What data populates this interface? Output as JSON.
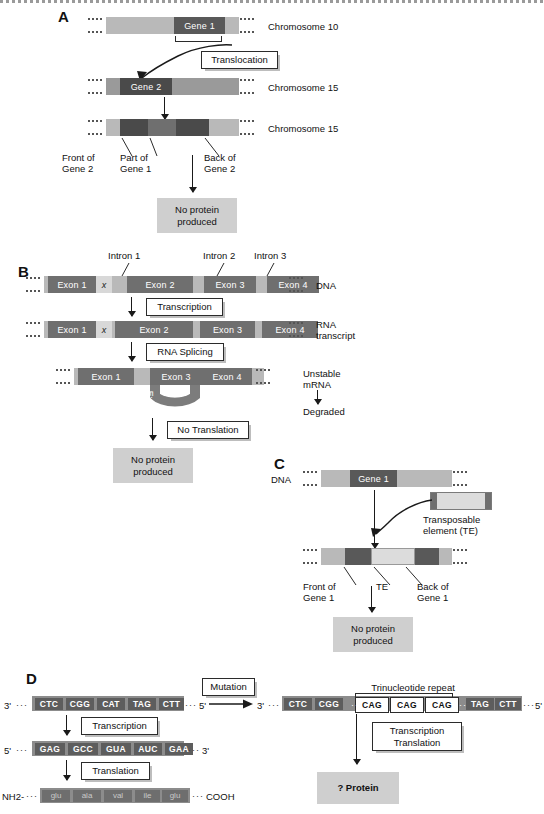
{
  "figure": {
    "panels": [
      "A",
      "B",
      "C",
      "D"
    ]
  },
  "panel_a": {
    "letter": "A",
    "rows": [
      {
        "gene_label": "Gene 1",
        "chromosome_label": "Chromosome 10"
      },
      {
        "gene_label": "Gene 2",
        "chromosome_label": "Chromosome 15"
      },
      {
        "gene_label": "",
        "chromosome_label": "Chromosome 15"
      }
    ],
    "process_label": "Translocation",
    "callouts": [
      "Front of\nGene 2",
      "Part of\nGene 1",
      "Back of\nGene 2"
    ],
    "result": "No protein\nproduced"
  },
  "panel_b": {
    "letter": "B",
    "intron_labels": [
      "Intron 1",
      "Intron 2",
      "Intron 3"
    ],
    "mutation_marker": "x",
    "dna_row": {
      "exons": [
        "Exon 1",
        "Exon 2",
        "Exon 3",
        "Exon 4"
      ],
      "row_label": "DNA"
    },
    "rna_row": {
      "exons": [
        "Exon 1",
        "Exon 2",
        "Exon 3",
        "Exon 4"
      ],
      "row_label": "RNA\ntranscript"
    },
    "spliced_row": {
      "exons": [
        "Exon 1",
        "Exon 3",
        "Exon 4"
      ],
      "looped_exon": "Exon 2"
    },
    "steps": [
      "Transcription",
      "RNA Splicing",
      "No Translation"
    ],
    "side_note": "Unstable\nmRNA",
    "side_note_result": "Degraded",
    "result": "No protein\nproduced"
  },
  "panel_c": {
    "letter": "C",
    "dna_label": "DNA",
    "gene_label": "Gene 1",
    "te_label": "Transposable\nelement (TE)",
    "callouts": [
      "Front of\nGene 1",
      "TE",
      "Back of\nGene 1"
    ],
    "result": "No protein\nproduced"
  },
  "panel_d": {
    "letter": "D",
    "left": {
      "dna_five_prime": "5'",
      "dna_three_prime": "3'",
      "dna_codons": [
        "CTC",
        "CGG",
        "CAT",
        "TAG",
        "CTT"
      ],
      "rna_five_prime": "5'",
      "rna_three_prime": "3'",
      "rna_codons": [
        "GAG",
        "GCC",
        "GUA",
        "AUC",
        "GAA"
      ],
      "protein_n_terminus": "NH2-",
      "protein_c_terminus": "COOH",
      "amino_acids": [
        "glu",
        "ala",
        "val",
        "ile",
        "glu"
      ],
      "steps": [
        "Transcription",
        "Translation"
      ]
    },
    "mutation_label": "Mutation",
    "arrow_from": "5'",
    "arrow_to": "3'",
    "right": {
      "repeat_label": "Trinucleotide repeat",
      "codons_before": [
        "CTC",
        "CGG"
      ],
      "repeat_codons": [
        "CAG",
        "CAG",
        "CAG"
      ],
      "codons_after": [
        "TAG",
        "CTT"
      ],
      "end_prime": "5'",
      "step": "Transcription\nTranslation",
      "result": "? Protein"
    }
  }
}
